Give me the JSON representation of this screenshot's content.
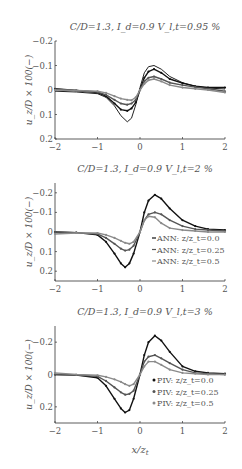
{
  "figure": {
    "ylabel": "u_z / D × 100(−)",
    "xlabel": "x/z_t"
  },
  "chart_data": [
    {
      "type": "line",
      "title": "C/D=1.3, I_d=0.9 V_l,t=0.95 %",
      "xlabel": "",
      "ylabel": "u_z/D × 100(−)",
      "xlim": [
        -2,
        2
      ],
      "ylim": [
        0.2,
        -0.2
      ],
      "yinverted": true,
      "xticks": [
        -2,
        -1,
        0,
        1,
        2
      ],
      "yticks": [
        -0.2,
        -0.1,
        0,
        0.1,
        0.2
      ],
      "yticklabels": [
        "−0.2",
        "−0.1",
        "0",
        "0.1",
        "0.2"
      ],
      "grid": false,
      "legend": null,
      "series": [
        {
          "name": "Analytical",
          "color": "#222222",
          "style": "line",
          "x": [
            -2,
            -1.5,
            -1,
            -0.8,
            -0.6,
            -0.45,
            -0.3,
            -0.2,
            -0.1,
            0,
            0.1,
            0.2,
            0.33,
            0.5,
            0.7,
            1,
            1.3,
            1.6,
            2
          ],
          "y": [
            0.005,
            0.008,
            0.015,
            0.03,
            0.065,
            0.105,
            0.13,
            0.115,
            0.06,
            -0.01,
            -0.07,
            -0.095,
            -0.1,
            -0.085,
            -0.055,
            -0.03,
            -0.015,
            -0.008,
            -0.004
          ]
        },
        {
          "name": "ANN: z/z_t=0.0",
          "color": "#111111",
          "style": "line+markers",
          "x": [
            -2,
            -1.5,
            -1,
            -0.8,
            -0.6,
            -0.45,
            -0.3,
            -0.2,
            -0.1,
            0,
            0.1,
            0.2,
            0.33,
            0.5,
            0.7,
            1,
            1.3,
            1.6,
            2
          ],
          "y": [
            -0.005,
            0.002,
            0.01,
            0.025,
            0.055,
            0.08,
            0.085,
            0.075,
            0.05,
            0.0,
            -0.05,
            -0.075,
            -0.085,
            -0.07,
            -0.045,
            -0.028,
            -0.015,
            -0.01,
            -0.01
          ]
        },
        {
          "name": "ANN: z/z_t=0.25",
          "color": "#555555",
          "style": "line+markers",
          "x": [
            -2,
            -1.5,
            -1,
            -0.8,
            -0.6,
            -0.45,
            -0.3,
            -0.2,
            -0.1,
            0,
            0.1,
            0.2,
            0.33,
            0.5,
            0.7,
            1,
            1.3,
            1.6,
            2
          ],
          "y": [
            -0.003,
            0.002,
            0.008,
            0.02,
            0.04,
            0.055,
            0.06,
            0.055,
            0.04,
            0.0,
            -0.035,
            -0.05,
            -0.055,
            -0.045,
            -0.03,
            -0.02,
            -0.012,
            -0.005,
            0.005
          ]
        },
        {
          "name": "ANN: z/z_t=0.5",
          "color": "#8a8a8a",
          "style": "line+markers",
          "x": [
            -2,
            -1.5,
            -1,
            -0.8,
            -0.6,
            -0.45,
            -0.3,
            -0.2,
            -0.1,
            0,
            0.1,
            0.2,
            0.33,
            0.5,
            0.7,
            1,
            1.3,
            1.6,
            2
          ],
          "y": [
            0.0,
            0.002,
            0.005,
            0.012,
            0.025,
            0.035,
            0.04,
            0.042,
            0.03,
            0.0,
            -0.025,
            -0.04,
            -0.045,
            -0.035,
            -0.02,
            -0.01,
            -0.005,
            0.0,
            0.01
          ]
        }
      ]
    },
    {
      "type": "line",
      "title": "C/D=1.3, I_d=0.9 V_l,t=2 %",
      "xlabel": "",
      "ylabel": "u_z/D × 100(−)",
      "xlim": [
        -2,
        2
      ],
      "ylim": [
        0.25,
        -0.25
      ],
      "yinverted": true,
      "xticks": [
        -2,
        -1,
        0,
        1,
        2
      ],
      "yticks": [
        -0.2,
        -0.1,
        0,
        0.1,
        0.2
      ],
      "yticklabels": [
        "−0.2",
        "−0.1",
        "0",
        "0.1",
        "0.2"
      ],
      "grid": false,
      "legend": {
        "position": "lower right",
        "entries": [
          "ANN: z/z_t=0.0",
          "ANN: z/z_t=0.25",
          "ANN: z/z_t=0.5"
        ]
      },
      "series": [
        {
          "name": "ANN: z/z_t=0.0",
          "color": "#111111",
          "style": "line+markers",
          "x": [
            -2,
            -1.5,
            -1,
            -0.8,
            -0.6,
            -0.45,
            -0.35,
            -0.25,
            -0.15,
            0,
            0.1,
            0.2,
            0.35,
            0.5,
            0.7,
            1,
            1.3,
            1.6,
            2
          ],
          "y": [
            0.0,
            0.003,
            0.015,
            0.05,
            0.11,
            0.16,
            0.18,
            0.16,
            0.11,
            0.0,
            -0.1,
            -0.16,
            -0.19,
            -0.17,
            -0.12,
            -0.06,
            -0.03,
            -0.015,
            -0.01
          ]
        },
        {
          "name": "ANN: z/z_t=0.25",
          "color": "#555555",
          "style": "line+markers",
          "x": [
            -2,
            -1.5,
            -1,
            -0.8,
            -0.6,
            -0.45,
            -0.35,
            -0.25,
            -0.15,
            0,
            0.1,
            0.2,
            0.35,
            0.5,
            0.7,
            1,
            1.3,
            1.6,
            2
          ],
          "y": [
            0.0,
            0.003,
            0.01,
            0.03,
            0.06,
            0.085,
            0.095,
            0.09,
            0.07,
            0.0,
            -0.06,
            -0.09,
            -0.1,
            -0.09,
            -0.06,
            -0.03,
            -0.015,
            -0.01,
            -0.005
          ]
        },
        {
          "name": "ANN: z/z_t=0.5",
          "color": "#8a8a8a",
          "style": "line+markers",
          "x": [
            -2,
            -1.5,
            -1,
            -0.8,
            -0.6,
            -0.45,
            -0.35,
            -0.25,
            -0.15,
            0,
            0.1,
            0.2,
            0.35,
            0.5,
            0.7,
            1,
            1.3,
            1.6,
            2
          ],
          "y": [
            0.01,
            0.005,
            0.005,
            0.015,
            0.03,
            0.045,
            0.055,
            0.06,
            0.05,
            0.0,
            -0.06,
            -0.08,
            -0.075,
            -0.045,
            -0.02,
            -0.01,
            -0.005,
            0.0,
            0.0
          ]
        }
      ]
    },
    {
      "type": "line",
      "title": "C/D=1.3, I_d=0.9 V_l,t=3 %",
      "xlabel": "x/z_t",
      "ylabel": "u_z/D × 100(−)",
      "xlim": [
        -2,
        2
      ],
      "ylim": [
        0.3,
        -0.3
      ],
      "yinverted": true,
      "xticks": [
        -2,
        -1,
        0,
        1,
        2
      ],
      "yticks": [
        -0.2,
        0,
        0.2
      ],
      "yticklabels": [
        "−0.2",
        "0",
        "0.2"
      ],
      "grid": false,
      "legend": {
        "position": "lower right",
        "entries": [
          "PIV: z/z_t=0.0",
          "PIV: z/z_t=0.25",
          "PIV: z/z_t=0.5"
        ]
      },
      "series": [
        {
          "name": "PIV: z/z_t=0.0",
          "color": "#111111",
          "style": "line+markers",
          "x": [
            -2,
            -1.5,
            -1,
            -0.8,
            -0.6,
            -0.45,
            -0.35,
            -0.25,
            -0.15,
            0,
            0.1,
            0.2,
            0.35,
            0.5,
            0.7,
            1,
            1.3,
            1.6,
            2
          ],
          "y": [
            0.0,
            0.003,
            0.02,
            0.07,
            0.15,
            0.21,
            0.235,
            0.22,
            0.15,
            0.0,
            -0.12,
            -0.2,
            -0.24,
            -0.21,
            -0.14,
            -0.05,
            -0.02,
            -0.01,
            -0.005
          ]
        },
        {
          "name": "PIV: z/z_t=0.25",
          "color": "#555555",
          "style": "line+markers",
          "x": [
            -2,
            -1.5,
            -1,
            -0.8,
            -0.6,
            -0.45,
            -0.35,
            -0.25,
            -0.15,
            0,
            0.1,
            0.2,
            0.35,
            0.5,
            0.7,
            1,
            1.3,
            1.6,
            2
          ],
          "y": [
            0.0,
            0.003,
            0.012,
            0.04,
            0.08,
            0.11,
            0.125,
            0.12,
            0.1,
            0.0,
            -0.08,
            -0.11,
            -0.12,
            -0.1,
            -0.07,
            -0.03,
            -0.01,
            -0.005,
            0.0
          ]
        },
        {
          "name": "PIV: z/z_t=0.5",
          "color": "#8a8a8a",
          "style": "line+markers",
          "x": [
            -2,
            -1.5,
            -1,
            -0.8,
            -0.6,
            -0.45,
            -0.35,
            -0.25,
            -0.15,
            0,
            0.1,
            0.2,
            0.35,
            0.5,
            0.7,
            1,
            1.3,
            1.6,
            2
          ],
          "y": [
            -0.01,
            0.0,
            0.005,
            0.015,
            0.03,
            0.045,
            0.06,
            0.07,
            0.06,
            0.0,
            -0.05,
            -0.08,
            -0.08,
            -0.06,
            -0.03,
            -0.01,
            -0.005,
            0.0,
            0.0
          ]
        }
      ]
    }
  ],
  "layout": {
    "panels": [
      {
        "top": 41,
        "bottom": 139,
        "left": 55,
        "right": 225,
        "title_y": 30,
        "xtick_y": 150
      },
      {
        "top": 183,
        "bottom": 281,
        "left": 55,
        "right": 225,
        "title_y": 172,
        "xtick_y": 292
      },
      {
        "top": 326,
        "bottom": 423,
        "left": 55,
        "right": 225,
        "title_y": 315,
        "xtick_y": 434
      }
    ],
    "xlabel_y": 452,
    "legend_x": 152
  }
}
